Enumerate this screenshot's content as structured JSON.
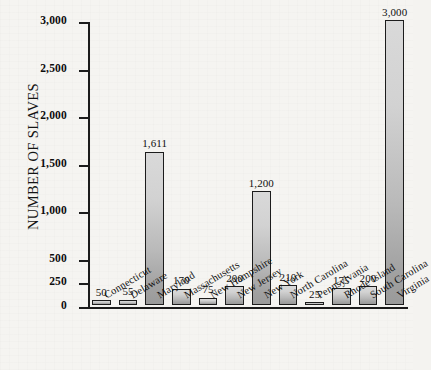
{
  "chart_data": {
    "type": "bar",
    "title": "",
    "xlabel": "",
    "ylabel": "NUMBER OF SLAVES",
    "ylim": [
      0,
      3000
    ],
    "grid": false,
    "legend": "none",
    "y_ticks": [
      "0",
      "250",
      "500",
      "1,000",
      "1,500",
      "2,000",
      "2,500",
      "3,000"
    ],
    "y_tick_values": [
      0,
      250,
      500,
      1000,
      1500,
      2000,
      2500,
      3000
    ],
    "categories": [
      "Connecticut",
      "Delaware",
      "Maryland",
      "Massachusetts",
      "New Hampshire",
      "New Jersey",
      "New York",
      "North Carolina",
      "Pennsylvania",
      "Rhode Island",
      "South Carolina",
      "Virginia"
    ],
    "values": [
      50,
      55,
      1611,
      170,
      75,
      200,
      1200,
      210,
      25,
      175,
      200,
      3000
    ],
    "value_labels": [
      "50",
      "55",
      "1,611",
      "170",
      "75",
      "200",
      "1,200",
      "210",
      "25",
      "175",
      "200",
      "3,000"
    ],
    "colors": {
      "bar_top": "#d9d9d9",
      "bar_bottom": "#9a9a9a",
      "bar_border": "#1c1c1c",
      "axis": "#1b1b1b",
      "text": "#101010",
      "background": "#f5f4f1"
    }
  }
}
